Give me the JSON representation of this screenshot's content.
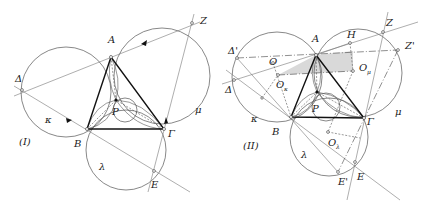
{
  "figure_i": {
    "caption": "(I)",
    "points": {
      "A": "A",
      "B": "B",
      "Gamma": "Γ",
      "P": "P",
      "Delta": "Δ",
      "Z": "Z",
      "E": "E"
    },
    "circles": {
      "kappa": "κ",
      "mu": "μ",
      "lambda": "λ"
    }
  },
  "figure_ii": {
    "caption": "(II)",
    "points": {
      "A": "A",
      "B": "B",
      "Gamma": "Γ",
      "P": "P",
      "Delta": "Δ",
      "Delta_prime": "Δ'",
      "Z": "Z",
      "Z_prime": "Z'",
      "E": "E",
      "E_prime": "E'",
      "H": "H",
      "O": "O",
      "O_kappa": "O",
      "O_kappa_sub": "κ",
      "O_mu": "O",
      "O_mu_sub": "μ",
      "O_lambda": "O",
      "O_lambda_sub": "λ"
    },
    "circles": {
      "kappa": "κ",
      "mu": "μ",
      "lambda": "λ"
    }
  }
}
